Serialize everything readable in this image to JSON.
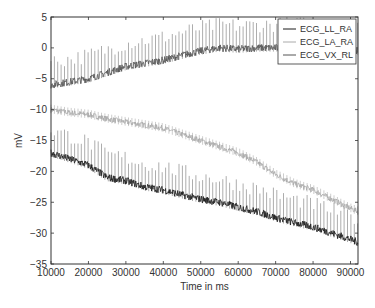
{
  "chart_data": {
    "type": "line",
    "title": "",
    "xlabel": "Time in ms",
    "ylabel": "mV",
    "xlim": [
      10000,
      92000
    ],
    "ylim": [
      -35,
      5
    ],
    "xticks": [
      10000,
      20000,
      30000,
      40000,
      50000,
      60000,
      70000,
      80000,
      90000
    ],
    "yticks": [
      5,
      0,
      -5,
      -10,
      -15,
      -20,
      -25,
      -30,
      -35
    ],
    "grid": false,
    "legend_position": "upper right",
    "series": [
      {
        "name": "ECG_LL_RA",
        "color": "#1a1a1a",
        "x": [
          10000,
          15000,
          20000,
          25000,
          30000,
          35000,
          40000,
          45000,
          50000,
          55000,
          60000,
          65000,
          70000,
          75000,
          80000,
          85000,
          90000,
          92000
        ],
        "values": [
          -17,
          -18,
          -19,
          -21,
          -21.5,
          -22.5,
          -23,
          -23.8,
          -24.5,
          -25,
          -25.8,
          -26.5,
          -27.5,
          -28.3,
          -29,
          -30,
          -31,
          -31.5
        ]
      },
      {
        "name": "ECG_LA_RA",
        "color": "#aaaaaa",
        "x": [
          10000,
          15000,
          20000,
          25000,
          30000,
          35000,
          40000,
          45000,
          50000,
          55000,
          60000,
          65000,
          70000,
          75000,
          80000,
          85000,
          90000,
          92000
        ],
        "values": [
          -10,
          -10.5,
          -10.8,
          -11.5,
          -12,
          -12.5,
          -13,
          -14,
          -15,
          -16,
          -17,
          -18.5,
          -20.5,
          -22,
          -23,
          -24.5,
          -26,
          -26.5
        ]
      },
      {
        "name": "ECG_VX_RL",
        "color": "#555555",
        "x": [
          10000,
          15000,
          20000,
          25000,
          30000,
          35000,
          40000,
          45000,
          50000,
          55000,
          60000,
          65000,
          70000,
          75000,
          80000,
          85000,
          90000,
          92000
        ],
        "values": [
          -6,
          -5.5,
          -5,
          -4,
          -3,
          -2.5,
          -2,
          -1.2,
          -0.5,
          0,
          -0.2,
          0,
          0,
          0.2,
          0,
          0,
          -0.3,
          -0.5
        ]
      }
    ]
  }
}
